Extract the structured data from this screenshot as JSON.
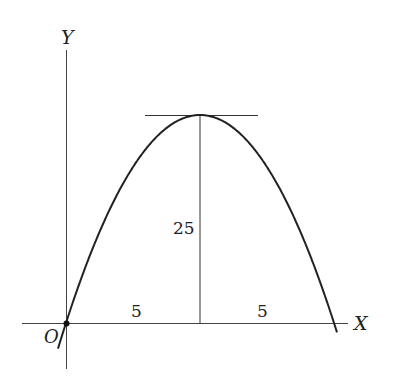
{
  "diagram": {
    "type": "parabola-trajectory",
    "axes": {
      "x_label": "X",
      "y_label": "Y",
      "origin_label": "O"
    },
    "labels": {
      "half_width_left": "5",
      "half_width_right": "5",
      "height": "25"
    },
    "colors": {
      "stroke": "#222222",
      "background": "#ffffff"
    }
  }
}
